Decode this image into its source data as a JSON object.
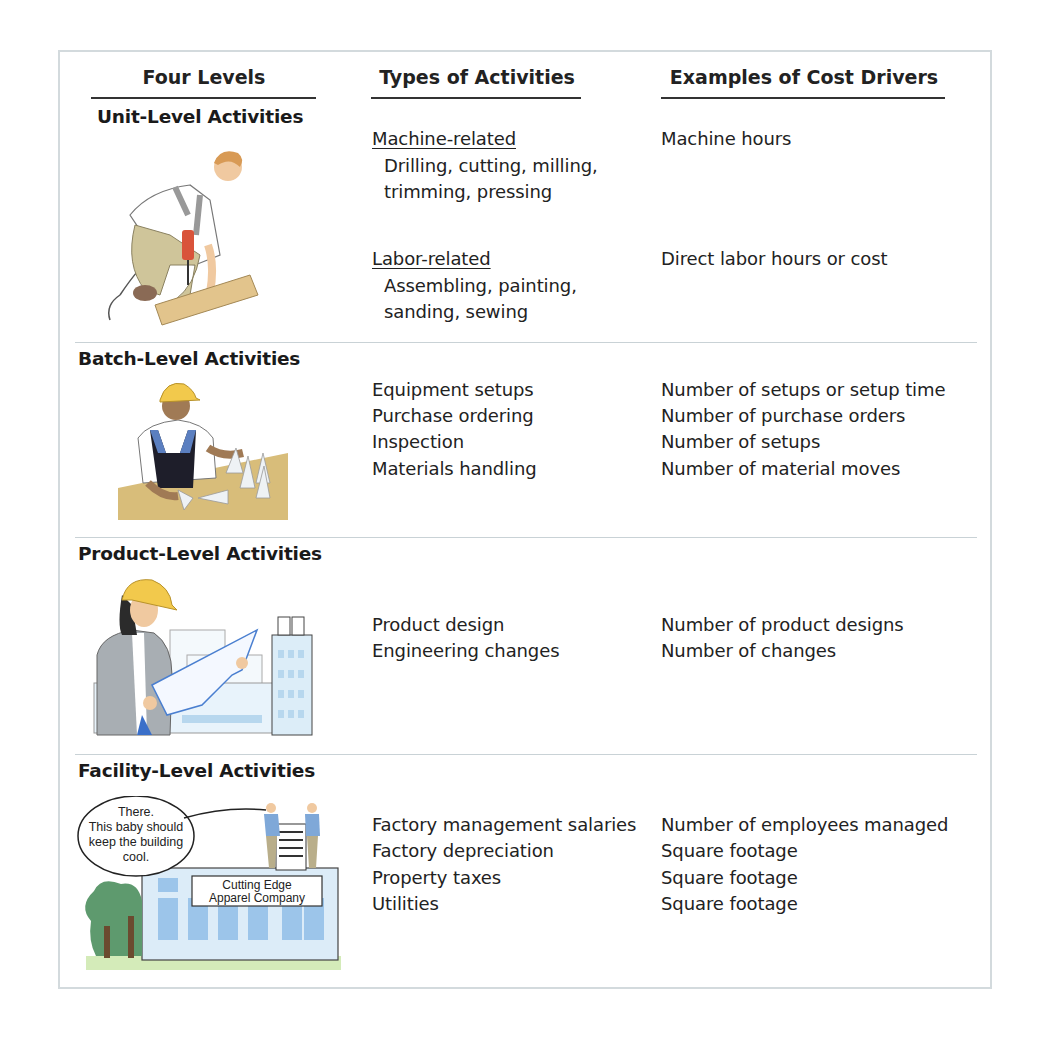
{
  "headers": {
    "col1": "Four Levels",
    "col2": "Types of Activities",
    "col3": "Examples of Cost Drivers"
  },
  "levels": [
    {
      "name": "Unit-Level Activities",
      "illustration": "worker-drilling-wood",
      "groups": [
        {
          "subheading": "Machine-related",
          "activities": [
            "Drilling, cutting, milling,",
            "trimming, pressing"
          ],
          "driver": "Machine hours"
        },
        {
          "subheading": "Labor-related",
          "activities": [
            "Assembling, painting,",
            "sanding, sewing"
          ],
          "driver": "Direct labor hours or cost"
        }
      ]
    },
    {
      "name": "Batch-Level Activities",
      "illustration": "worker-with-cones",
      "rows": [
        {
          "activity": "Equipment setups",
          "driver": "Number of setups or setup time"
        },
        {
          "activity": "Purchase ordering",
          "driver": "Number of purchase orders"
        },
        {
          "activity": "Inspection",
          "driver": "Number of setups"
        },
        {
          "activity": "Materials handling",
          "driver": "Number of material moves"
        }
      ]
    },
    {
      "name": "Product-Level Activities",
      "illustration": "engineer-with-blueprint",
      "rows": [
        {
          "activity": "Product design",
          "driver": "Number of product designs"
        },
        {
          "activity": "Engineering changes",
          "driver": "Number of changes"
        }
      ]
    },
    {
      "name": "Facility-Level Activities",
      "illustration": "factory-building",
      "speech_bubble": [
        "There.",
        "This baby should",
        "keep the building",
        "cool."
      ],
      "building_sign": [
        "Cutting Edge",
        "Apparel Company"
      ],
      "rows": [
        {
          "activity": "Factory management salaries",
          "driver": "Number of employees managed"
        },
        {
          "activity": "Factory depreciation",
          "driver": "Square footage"
        },
        {
          "activity": "Property taxes",
          "driver": "Square footage"
        },
        {
          "activity": "Utilities",
          "driver": "Square footage"
        }
      ]
    }
  ],
  "colors": {
    "frame_border": "#d3dadd",
    "separator": "#c9d2d6",
    "text": "#222222"
  }
}
